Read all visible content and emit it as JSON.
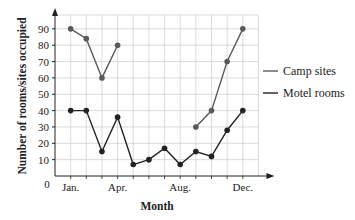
{
  "chart_data": {
    "type": "line",
    "title": "",
    "xlabel": "Month",
    "ylabel": "Number of rooms/sites occupied",
    "x": [
      "Jan.",
      "Feb.",
      "Mar.",
      "Apr.",
      "May",
      "Jun.",
      "Jul.",
      "Aug.",
      "Sep.",
      "Oct.",
      "Nov.",
      "Dec."
    ],
    "x_tick_labels": [
      "Jan.",
      "Apr.",
      "Aug.",
      "Dec."
    ],
    "y_ticks": [
      10,
      20,
      30,
      40,
      50,
      60,
      70,
      80,
      90
    ],
    "origin_label": "0",
    "ylim": [
      0,
      100
    ],
    "grid": true,
    "legend_position": "right",
    "series": [
      {
        "name": "Camp sites",
        "color": "#5a5a5a",
        "values": [
          90,
          84,
          60,
          80,
          null,
          null,
          null,
          null,
          30,
          40,
          70,
          90
        ]
      },
      {
        "name": "Motel rooms",
        "color": "#222222",
        "values": [
          40,
          40,
          15,
          36,
          7,
          10,
          17,
          7,
          15,
          12,
          28,
          40
        ]
      }
    ]
  }
}
